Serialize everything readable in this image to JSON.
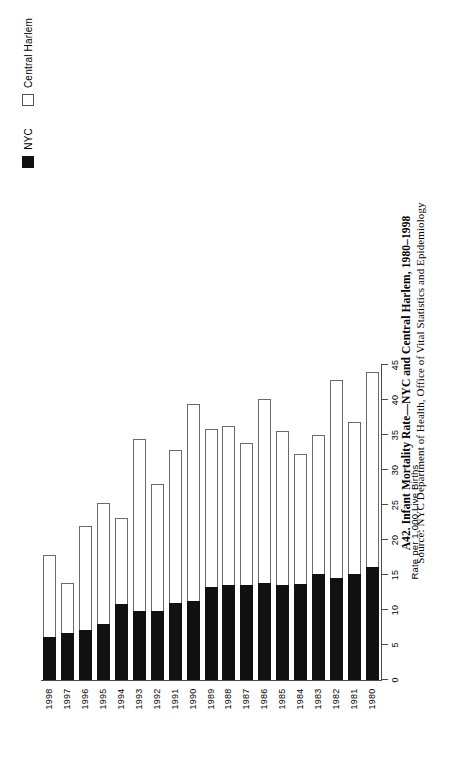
{
  "caption": {
    "title": "A42. Infant Mortality Rate—NYC and Central Harlem, 1980–1998",
    "source": "Source: NYC Department of Health, Office of Vital Statistics and Epidemiology"
  },
  "legend": {
    "position": "top-right",
    "items": [
      {
        "label": "NYC",
        "color": "#111111",
        "swatch": "filled-square-icon"
      },
      {
        "label": "Central Harlem",
        "color": "#ffffff",
        "swatch": "outlined-square-icon"
      }
    ]
  },
  "axes": {
    "value_axis_title": "Rate per 1,000 Live Births",
    "value_ticks": [
      "0",
      "5",
      "10",
      "15",
      "20",
      "25",
      "30",
      "35",
      "40",
      "45"
    ],
    "category_ticks": [
      "1980",
      "1981",
      "1982",
      "1983",
      "1984",
      "1985",
      "1986",
      "1987",
      "1988",
      "1989",
      "1990",
      "1991",
      "1992",
      "1993",
      "1994",
      "1995",
      "1996",
      "1997",
      "1998"
    ]
  },
  "chart_data": {
    "type": "bar",
    "orientation": "horizontal",
    "title": "A42. Infant Mortality Rate—NYC and Central Harlem, 1980–1998",
    "subtitle": "Source: NYC Department of Health, Office of Vital Statistics and Epidemiology",
    "xlabel": "",
    "ylabel": "Rate per 1,000 Live Births",
    "ylim": [
      0,
      45
    ],
    "ytick_step": 5,
    "grid": false,
    "legend_position": "top-right",
    "categories": [
      "1980",
      "1981",
      "1982",
      "1983",
      "1984",
      "1985",
      "1986",
      "1987",
      "1988",
      "1989",
      "1990",
      "1991",
      "1992",
      "1993",
      "1994",
      "1995",
      "1996",
      "1997",
      "1998"
    ],
    "series": [
      {
        "name": "NYC",
        "color": "#111111",
        "values": [
          16.1,
          15.2,
          14.5,
          15.2,
          13.7,
          13.6,
          13.8,
          13.6,
          13.5,
          13.3,
          11.3,
          11.0,
          9.9,
          9.9,
          10.9,
          8.0,
          7.1,
          6.7,
          6.2
        ]
      },
      {
        "name": "Central Harlem",
        "color": "#ffffff",
        "values": [
          44.0,
          36.8,
          42.9,
          35.0,
          32.3,
          35.6,
          40.1,
          33.8,
          36.3,
          35.9,
          39.4,
          32.8,
          28.0,
          34.4,
          23.1,
          25.3,
          22.0,
          13.9,
          17.8
        ]
      }
    ]
  }
}
